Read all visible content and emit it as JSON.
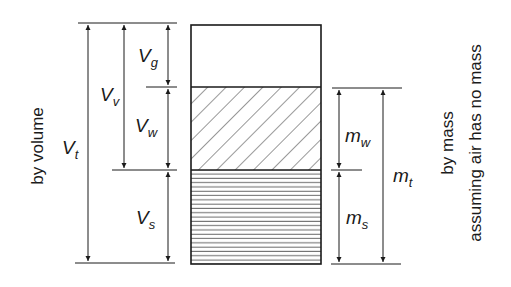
{
  "diagram": {
    "type": "soil-phase-diagram",
    "phases": [
      {
        "name": "gas",
        "pattern": "empty"
      },
      {
        "name": "water",
        "pattern": "diagonal-hatch"
      },
      {
        "name": "solid",
        "pattern": "horizontal-lines"
      }
    ],
    "left_labels": {
      "Vt_main": "V",
      "Vt_sub": "t",
      "Vv_main": "V",
      "Vv_sub": "v",
      "Vg_main": "V",
      "Vg_sub": "g",
      "Vw_main": "V",
      "Vw_sub": "w",
      "Vs_main": "V",
      "Vs_sub": "s"
    },
    "right_labels": {
      "mw_main": "m",
      "mw_sub": "w",
      "ms_main": "m",
      "ms_sub": "s",
      "mt_main": "m",
      "mt_sub": "t"
    },
    "side_text": {
      "left": "by volume",
      "right_line1": "by mass",
      "right_line2": "assuming air has no mass"
    },
    "colors": {
      "line": "#1a1a1a",
      "background": "#ffffff"
    }
  }
}
